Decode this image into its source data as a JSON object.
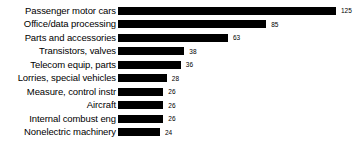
{
  "chart_data": {
    "type": "bar",
    "orientation": "horizontal",
    "title": "",
    "subtitle": "",
    "xlabel": "",
    "ylabel": "",
    "grid": false,
    "legend": null,
    "axis_line": false,
    "tick_labels": [],
    "xlim": [
      0,
      125
    ],
    "value_labels_shown": true,
    "bar_color": "#000000",
    "background_color": "#ffffff",
    "categories": [
      "Passenger motor cars",
      "Office/data processing",
      "Parts and accessories",
      "Transistors, valves",
      "Telecom equip, parts",
      "Lorries, special vehicles",
      "Measure, control instr",
      "Aircraft",
      "Internal combust eng",
      "Nonelectric machinery"
    ],
    "values": [
      125,
      85,
      63,
      38,
      36,
      28,
      26,
      26,
      26,
      24
    ],
    "bars": [
      {
        "label": "Passenger motor cars",
        "value": 125,
        "value_text": "125"
      },
      {
        "label": "Office/data processing",
        "value": 85,
        "value_text": "85"
      },
      {
        "label": "Parts and accessories",
        "value": 63,
        "value_text": "63"
      },
      {
        "label": "Transistors, valves",
        "value": 38,
        "value_text": "38"
      },
      {
        "label": "Telecom equip, parts",
        "value": 36,
        "value_text": "36"
      },
      {
        "label": "Lorries, special vehicles",
        "value": 28,
        "value_text": "28"
      },
      {
        "label": "Measure, control instr",
        "value": 26,
        "value_text": "26"
      },
      {
        "label": "Aircraft",
        "value": 26,
        "value_text": "26"
      },
      {
        "label": "Internal combust eng",
        "value": 26,
        "value_text": "26"
      },
      {
        "label": "Nonelectric machinery",
        "value": 24,
        "value_text": "24"
      }
    ]
  }
}
